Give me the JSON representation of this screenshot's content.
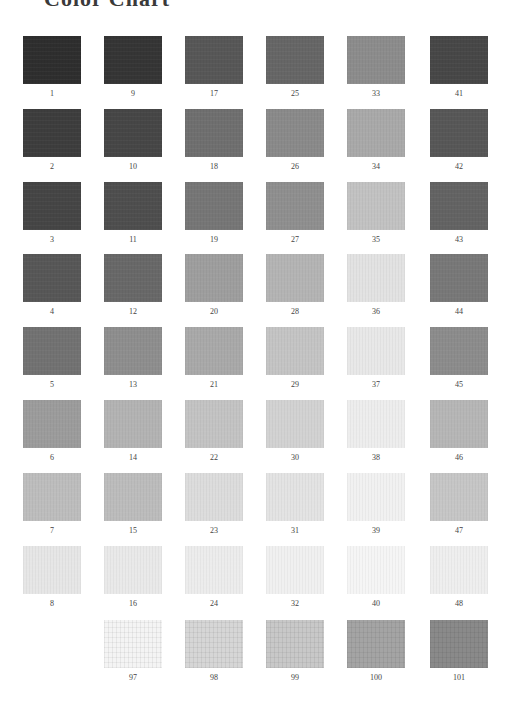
{
  "title": "Color Chart",
  "layout": {
    "col_x": [
      23,
      104,
      185,
      266,
      347,
      430
    ],
    "row_y": [
      36,
      109,
      182,
      254,
      327,
      400,
      473,
      546,
      620
    ]
  },
  "swatches": [
    {
      "number": "1",
      "col": 0,
      "row": 0,
      "color": "#2e2e2e"
    },
    {
      "number": "2",
      "col": 0,
      "row": 1,
      "color": "#3d3d3d"
    },
    {
      "number": "3",
      "col": 0,
      "row": 2,
      "color": "#454545"
    },
    {
      "number": "4",
      "col": 0,
      "row": 3,
      "color": "#575757"
    },
    {
      "number": "5",
      "col": 0,
      "row": 4,
      "color": "#727272"
    },
    {
      "number": "6",
      "col": 0,
      "row": 5,
      "color": "#9c9c9c"
    },
    {
      "number": "7",
      "col": 0,
      "row": 6,
      "color": "#bdbdbd"
    },
    {
      "number": "8",
      "col": 0,
      "row": 7,
      "color": "#e6e6e6"
    },
    {
      "number": "9",
      "col": 1,
      "row": 0,
      "color": "#353535"
    },
    {
      "number": "10",
      "col": 1,
      "row": 1,
      "color": "#464646"
    },
    {
      "number": "11",
      "col": 1,
      "row": 2,
      "color": "#4e4e4e"
    },
    {
      "number": "12",
      "col": 1,
      "row": 3,
      "color": "#686868"
    },
    {
      "number": "13",
      "col": 1,
      "row": 4,
      "color": "#8e8e8e"
    },
    {
      "number": "14",
      "col": 1,
      "row": 5,
      "color": "#b3b3b3"
    },
    {
      "number": "15",
      "col": 1,
      "row": 6,
      "color": "#bcbcbc"
    },
    {
      "number": "16",
      "col": 1,
      "row": 7,
      "color": "#e9e9e9"
    },
    {
      "number": "17",
      "col": 2,
      "row": 0,
      "color": "#575757"
    },
    {
      "number": "18",
      "col": 2,
      "row": 1,
      "color": "#6f6f6f"
    },
    {
      "number": "19",
      "col": 2,
      "row": 2,
      "color": "#767676"
    },
    {
      "number": "20",
      "col": 2,
      "row": 3,
      "color": "#9e9e9e"
    },
    {
      "number": "21",
      "col": 2,
      "row": 4,
      "color": "#a9a9a9"
    },
    {
      "number": "22",
      "col": 2,
      "row": 5,
      "color": "#c3c3c3"
    },
    {
      "number": "23",
      "col": 2,
      "row": 6,
      "color": "#dcdcdc"
    },
    {
      "number": "24",
      "col": 2,
      "row": 7,
      "color": "#ececec"
    },
    {
      "number": "25",
      "col": 3,
      "row": 0,
      "color": "#666666"
    },
    {
      "number": "26",
      "col": 3,
      "row": 1,
      "color": "#8a8a8a"
    },
    {
      "number": "27",
      "col": 3,
      "row": 2,
      "color": "#8f8f8f"
    },
    {
      "number": "28",
      "col": 3,
      "row": 3,
      "color": "#b4b4b4"
    },
    {
      "number": "29",
      "col": 3,
      "row": 4,
      "color": "#c4c4c4"
    },
    {
      "number": "30",
      "col": 3,
      "row": 5,
      "color": "#d2d2d2"
    },
    {
      "number": "31",
      "col": 3,
      "row": 6,
      "color": "#e3e3e3"
    },
    {
      "number": "32",
      "col": 3,
      "row": 7,
      "color": "#f0f0f0"
    },
    {
      "number": "33",
      "col": 4,
      "row": 0,
      "color": "#8c8c8c"
    },
    {
      "number": "34",
      "col": 4,
      "row": 1,
      "color": "#a9a9a9"
    },
    {
      "number": "35",
      "col": 4,
      "row": 2,
      "color": "#c2c2c2"
    },
    {
      "number": "36",
      "col": 4,
      "row": 3,
      "color": "#e2e2e2"
    },
    {
      "number": "37",
      "col": 4,
      "row": 4,
      "color": "#e8e8e8"
    },
    {
      "number": "38",
      "col": 4,
      "row": 5,
      "color": "#ededed"
    },
    {
      "number": "39",
      "col": 4,
      "row": 6,
      "color": "#f1f1f1"
    },
    {
      "number": "40",
      "col": 4,
      "row": 7,
      "color": "#f5f5f5"
    },
    {
      "number": "41",
      "col": 5,
      "row": 0,
      "color": "#474747"
    },
    {
      "number": "42",
      "col": 5,
      "row": 1,
      "color": "#575757"
    },
    {
      "number": "43",
      "col": 5,
      "row": 2,
      "color": "#636363"
    },
    {
      "number": "44",
      "col": 5,
      "row": 3,
      "color": "#787878"
    },
    {
      "number": "45",
      "col": 5,
      "row": 4,
      "color": "#8c8c8c"
    },
    {
      "number": "46",
      "col": 5,
      "row": 5,
      "color": "#b6b6b6"
    },
    {
      "number": "47",
      "col": 5,
      "row": 6,
      "color": "#c6c6c6"
    },
    {
      "number": "48",
      "col": 5,
      "row": 7,
      "color": "#eeeeee"
    },
    {
      "number": "97",
      "col": 1,
      "row": 8,
      "color": "#f4f4f4",
      "textured": true
    },
    {
      "number": "98",
      "col": 2,
      "row": 8,
      "color": "#d6d6d6",
      "textured": true
    },
    {
      "number": "99",
      "col": 3,
      "row": 8,
      "color": "#c8c8c8",
      "textured": true
    },
    {
      "number": "100",
      "col": 4,
      "row": 8,
      "color": "#a4a4a4",
      "textured": true
    },
    {
      "number": "101",
      "col": 5,
      "row": 8,
      "color": "#8a8a8a",
      "textured": true
    }
  ]
}
